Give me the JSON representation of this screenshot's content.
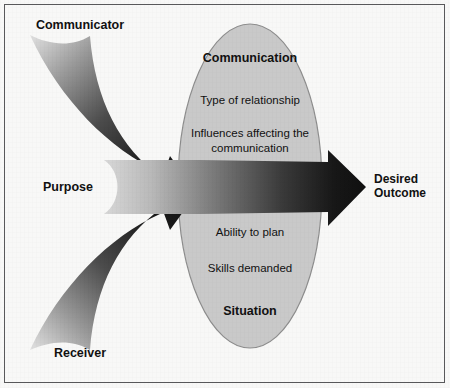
{
  "figure": {
    "background_color": "#f8f8f7",
    "border_color": "#58585a"
  },
  "colors": {
    "ellipse_fill": "#c9c9c9",
    "ellipse_stroke": "#8d8d8d",
    "arrow_dark": "#141414",
    "arrow_light": "#d5d5d5",
    "text": "#111111"
  },
  "inputs": [
    {
      "id": "communicator",
      "label": "Communicator",
      "position": "top-left",
      "arrow": "curved-arrow-down-right-icon"
    },
    {
      "id": "purpose",
      "label": "Purpose",
      "position": "middle-left",
      "arrow": "straight-arrow-right-icon"
    },
    {
      "id": "receiver",
      "label": "Receiver",
      "position": "bottom-left",
      "arrow": "curved-arrow-up-right-icon"
    }
  ],
  "ellipse": {
    "heading_top": "Communication",
    "heading_bottom": "Situation",
    "items": [
      "Type of relationship",
      "Influences affecting the",
      "communication",
      "Ability to plan",
      "Skills demanded"
    ],
    "factors": [
      {
        "text": "Type of relationship"
      },
      {
        "text_line1": "Influences affecting the",
        "text_line2": "communication"
      },
      {
        "text": "Ability to plan"
      },
      {
        "text": "Skills demanded"
      }
    ]
  },
  "output": {
    "label_line1": "Desired",
    "label_line2": "Outcome",
    "arrowhead": "arrowhead-right-icon"
  }
}
